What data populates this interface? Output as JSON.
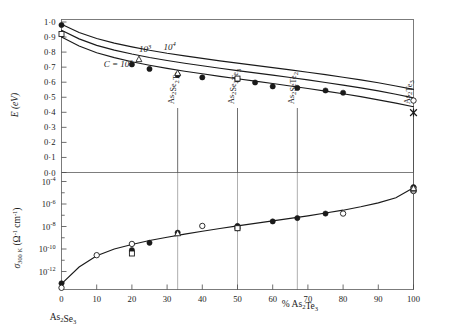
{
  "chart_data": {
    "type": "scatter",
    "title": "",
    "subtitle": "",
    "panels": [
      {
        "id": "upper",
        "ylabel": "E (eV)",
        "ylim": [
          0.0,
          1.0
        ],
        "yticks": [
          "0·0",
          "0·1",
          "0·2",
          "0·3",
          "0·4",
          "0·5",
          "0·6",
          "0·7",
          "0·8",
          "0·9",
          "1·0"
        ],
        "ytick_values": [
          0.0,
          0.1,
          0.2,
          0.3,
          0.4,
          0.5,
          0.6,
          0.7,
          0.8,
          0.9,
          1.0
        ],
        "xlim": [
          0,
          100
        ],
        "grid": false,
        "curve_labels": [
          {
            "text": "C = 10²",
            "x": 12,
            "y": 0.7
          },
          {
            "text": "10³",
            "x": 22,
            "y": 0.8
          },
          {
            "text": "10⁴",
            "x": 29,
            "y": 0.815
          }
        ],
        "series": [
          {
            "name": "C = 10⁴",
            "type": "line",
            "x": [
              0,
              5,
              10,
              15,
              20,
              25,
              30,
              35,
              40,
              45,
              50,
              55,
              60,
              65,
              70,
              75,
              80,
              85,
              90,
              95,
              100
            ],
            "y": [
              0.985,
              0.93,
              0.89,
              0.86,
              0.835,
              0.812,
              0.792,
              0.775,
              0.758,
              0.742,
              0.727,
              0.712,
              0.697,
              0.682,
              0.666,
              0.65,
              0.633,
              0.615,
              0.596,
              0.575,
              0.552
            ]
          },
          {
            "name": "C = 10³",
            "type": "line",
            "x": [
              0,
              5,
              10,
              15,
              20,
              25,
              30,
              35,
              40,
              45,
              50,
              55,
              60,
              65,
              70,
              75,
              80,
              85,
              90,
              95,
              100
            ],
            "y": [
              0.945,
              0.888,
              0.845,
              0.813,
              0.787,
              0.764,
              0.744,
              0.726,
              0.709,
              0.693,
              0.677,
              0.662,
              0.647,
              0.631,
              0.615,
              0.598,
              0.581,
              0.562,
              0.542,
              0.52,
              0.496
            ]
          },
          {
            "name": "C = 10²",
            "type": "line",
            "x": [
              0,
              5,
              10,
              15,
              20,
              25,
              30,
              35,
              40,
              45,
              50,
              55,
              60,
              65,
              70,
              75,
              80,
              85,
              90,
              95,
              100
            ],
            "y": [
              0.9,
              0.84,
              0.796,
              0.763,
              0.736,
              0.713,
              0.692,
              0.673,
              0.656,
              0.639,
              0.623,
              0.607,
              0.591,
              0.575,
              0.558,
              0.541,
              0.523,
              0.504,
              0.483,
              0.461,
              0.437
            ]
          },
          {
            "name": "filled-circle-data",
            "type": "points",
            "marker": "filled-circle",
            "points": [
              {
                "x": 0,
                "y": 0.98
              },
              {
                "x": 20,
                "y": 0.718
              },
              {
                "x": 25,
                "y": 0.688
              },
              {
                "x": 33,
                "y": 0.648
              },
              {
                "x": 40,
                "y": 0.632
              },
              {
                "x": 50,
                "y": 0.618
              },
              {
                "x": 55,
                "y": 0.598
              },
              {
                "x": 60,
                "y": 0.572
              },
              {
                "x": 67,
                "y": 0.562
              },
              {
                "x": 75,
                "y": 0.545
              },
              {
                "x": 80,
                "y": 0.53
              }
            ]
          },
          {
            "name": "open-triangle-data",
            "type": "points",
            "marker": "open-triangle",
            "points": [
              {
                "x": 22,
                "y": 0.752
              },
              {
                "x": 33,
                "y": 0.66
              }
            ]
          },
          {
            "name": "open-square-data",
            "type": "points",
            "marker": "open-square",
            "points": [
              {
                "x": 0,
                "y": 0.92
              },
              {
                "x": 50,
                "y": 0.624
              }
            ]
          },
          {
            "name": "open-circle-data",
            "type": "points",
            "marker": "open-circle",
            "points": [
              {
                "x": 100,
                "y": 0.478
              }
            ]
          },
          {
            "name": "star-data",
            "type": "points",
            "marker": "star",
            "points": [
              {
                "x": 100,
                "y": 0.398
              }
            ]
          }
        ],
        "vertical_markers": [
          {
            "x": 33,
            "label": "As₂Se₂Te"
          },
          {
            "x": 50,
            "label": "As₂Se₃Te₃"
          },
          {
            "x": 67,
            "label": "As₂SeTe₂"
          },
          {
            "x": 100,
            "label": "As₂Te₃"
          }
        ]
      },
      {
        "id": "lower",
        "ylabel": "σ₃₀₀ K (Ω⁻¹ cm⁻¹)",
        "yticks": [
          "10⁻¹²",
          "10⁻¹⁰",
          "10⁻⁸",
          "10⁻⁶",
          "10⁻⁴",
          "0·0"
        ],
        "ytick_exponents": [
          -12,
          -10,
          -8,
          -6,
          -4
        ],
        "ylim_log": [
          -13.6,
          -3.2
        ],
        "grid": false,
        "series": [
          {
            "name": "conductivity-fit",
            "type": "line",
            "x": [
              0,
              5,
              10,
              15,
              20,
              25,
              30,
              35,
              40,
              45,
              50,
              55,
              60,
              65,
              70,
              75,
              80,
              85,
              90,
              95,
              100
            ],
            "y_log": [
              -13.1,
              -11.6,
              -10.6,
              -10.0,
              -9.6,
              -9.25,
              -8.95,
              -8.68,
              -8.42,
              -8.18,
              -7.95,
              -7.72,
              -7.5,
              -7.28,
              -7.05,
              -6.8,
              -6.55,
              -6.25,
              -5.9,
              -5.45,
              -4.55
            ]
          },
          {
            "name": "filled-circle-data",
            "type": "points",
            "marker": "filled-circle",
            "points": [
              {
                "x": 0,
                "y_log": -13.05
              },
              {
                "x": 20,
                "y_log": -10.1
              },
              {
                "x": 25,
                "y_log": -9.45
              },
              {
                "x": 33,
                "y_log": -8.55
              },
              {
                "x": 50,
                "y_log": -7.95
              },
              {
                "x": 60,
                "y_log": -7.55
              },
              {
                "x": 67,
                "y_log": -7.25
              },
              {
                "x": 75,
                "y_log": -6.85
              },
              {
                "x": 100,
                "y_log": -4.5
              }
            ]
          },
          {
            "name": "open-circle-data",
            "type": "points",
            "marker": "open-circle",
            "points": [
              {
                "x": 0,
                "y_log": -13.45
              },
              {
                "x": 10,
                "y_log": -10.55
              },
              {
                "x": 20,
                "y_log": -9.55
              },
              {
                "x": 40,
                "y_log": -7.95
              },
              {
                "x": 50,
                "y_log": -8.15
              },
              {
                "x": 80,
                "y_log": -6.85
              },
              {
                "x": 100,
                "y_log": -4.85
              }
            ]
          },
          {
            "name": "open-square-data",
            "type": "points",
            "marker": "open-square",
            "points": [
              {
                "x": 20,
                "y_log": -10.4
              },
              {
                "x": 50,
                "y_log": -8.15
              },
              {
                "x": 100,
                "y_log": -4.7
              }
            ]
          },
          {
            "name": "open-triangle-data",
            "type": "points",
            "marker": "open-triangle",
            "points": [
              {
                "x": 33,
                "y_log": -8.62
              },
              {
                "x": 100,
                "y_log": -4.6
              }
            ]
          }
        ],
        "vertical_markers": [
          {
            "x": 33
          },
          {
            "x": 50
          },
          {
            "x": 67
          },
          {
            "x": 100
          }
        ]
      }
    ],
    "xlabel": "% As₂Te₃",
    "xlabel_left": "As₂Se₃",
    "xticks": [
      "0",
      "10",
      "20",
      "30",
      "40",
      "50",
      "60",
      "70",
      "80",
      "90",
      "100"
    ],
    "xtick_values": [
      0,
      10,
      20,
      30,
      40,
      50,
      60,
      70,
      80,
      90,
      100
    ]
  },
  "colors": {
    "ink": "#1a1a1a",
    "frame": "#6e6e6e",
    "background": "#ffffff"
  }
}
